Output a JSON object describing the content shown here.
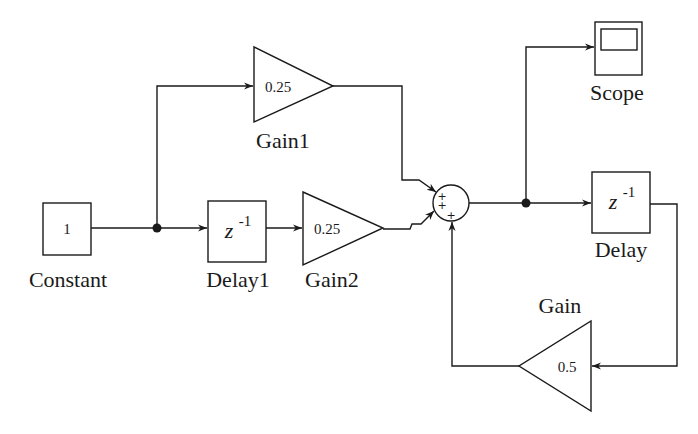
{
  "diagram": {
    "type": "simulink-block-diagram",
    "blocks": {
      "constant": {
        "name": "Constant",
        "value": "1"
      },
      "delay1": {
        "name": "Delay1",
        "operator": "z",
        "exponent": "-1"
      },
      "gain1": {
        "name": "Gain1",
        "value": "0.25"
      },
      "gain2": {
        "name": "Gain2",
        "value": "0.25"
      },
      "sum": {
        "signs": [
          "+",
          "+",
          "+"
        ]
      },
      "scope": {
        "name": "Scope"
      },
      "delay": {
        "name": "Delay",
        "operator": "z",
        "exponent": "-1"
      },
      "gain": {
        "name": "Gain",
        "value": "0.5"
      }
    },
    "connections": [
      {
        "from": "Constant",
        "to": "Delay1"
      },
      {
        "from": "Constant",
        "to": "Gain1"
      },
      {
        "from": "Delay1",
        "to": "Gain2"
      },
      {
        "from": "Gain1",
        "to": "Sum"
      },
      {
        "from": "Gain2",
        "to": "Sum"
      },
      {
        "from": "Sum",
        "to": "Scope"
      },
      {
        "from": "Sum",
        "to": "Delay"
      },
      {
        "from": "Delay",
        "to": "Gain"
      },
      {
        "from": "Gain",
        "to": "Sum"
      }
    ],
    "colors": {
      "line": "#1a1a1a",
      "background": "#ffffff"
    }
  }
}
